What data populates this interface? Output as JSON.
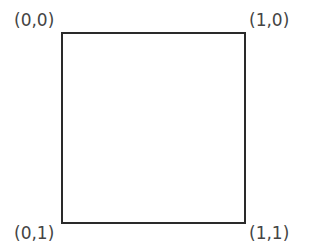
{
  "diagram": {
    "type": "unit-square-coordinates",
    "shape": "square",
    "stroke_color": "#2a2a2a",
    "label_color": "#444444",
    "corners": {
      "top_left": "(0,0)",
      "top_right": "(1,0)",
      "bottom_left": "(0,1)",
      "bottom_right": "(1,1)"
    }
  }
}
